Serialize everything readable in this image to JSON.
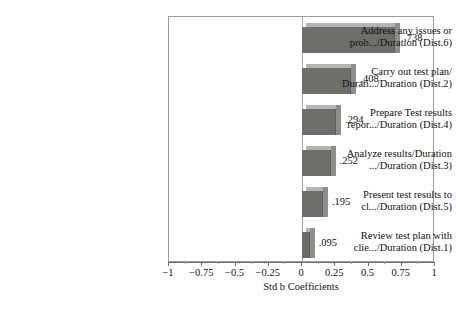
{
  "chart_data": {
    "type": "bar",
    "orientation": "horizontal",
    "title": "",
    "xlabel": "Std b Coefficients",
    "ylabel": "",
    "xlim": [
      -1,
      1
    ],
    "grid": false,
    "legend": "none",
    "xticks": [
      "−1",
      "−0.75",
      "−0.5",
      "−0.25",
      "0",
      "0.25",
      "0.5",
      "0.75",
      "1"
    ],
    "xtick_values": [
      -1,
      -0.75,
      -0.5,
      -0.25,
      0,
      0.25,
      0.5,
      0.75,
      1
    ],
    "categories": [
      "Address any issues or\nprob.../Duration (Dist.6)",
      "Carry out test plan/\nDurati.../Duration (Dist.2)",
      "Prepare Test results\nrepor.../Duration (Dist.4)",
      "Analyze results/Duration\n.../Duration (Dist.3)",
      "Present test results to\ncl.../Duration (Dist.5)",
      "Review test plan with\nclie.../Duration (Dist.1)"
    ],
    "values": [
      0.738,
      0.408,
      0.294,
      0.252,
      0.195,
      0.095
    ],
    "value_labels": [
      ".738",
      ".408",
      ".294",
      ".252",
      ".195",
      ".095"
    ],
    "bar_color": "#6e6e6b",
    "bar_top_color": "#b4b4b0",
    "bar_side_color": "#8d8d8a",
    "frame_color": "#9a9a9a",
    "axis_color": "#6f6f6f",
    "text_color": "#111111",
    "background": "#ffffff"
  }
}
